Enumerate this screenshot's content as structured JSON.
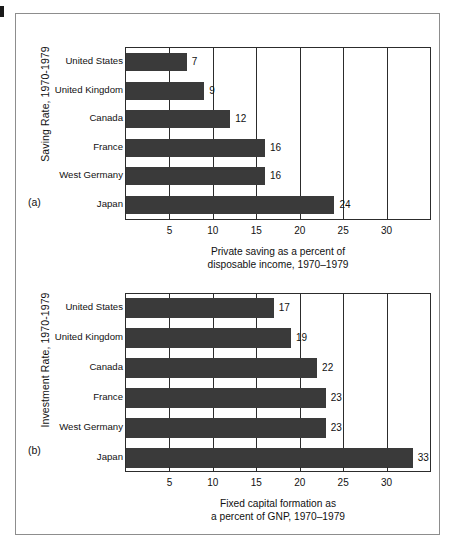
{
  "figure": {
    "panels": [
      {
        "id": "a",
        "panel_label": "(a)",
        "vertical_title": "Saving Rate, 1970-1979",
        "caption_line1": "Private saving as a percent of",
        "caption_line2": "disposable income, 1970–1979"
      },
      {
        "id": "b",
        "panel_label": "(b)",
        "vertical_title": "Investment Rate, 1970-1979",
        "caption_line1": "Fixed capital formation as",
        "caption_line2": "a percent of GNP, 1970–1979"
      }
    ]
  },
  "chart_data": [
    {
      "type": "bar",
      "orientation": "horizontal",
      "title": "Saving Rate, 1970-1979",
      "panel": "(a)",
      "xlabel": "Private saving as a percent of disposable income, 1970–1979",
      "ylabel": "",
      "categories": [
        "United States",
        "United Kingdom",
        "Canada",
        "France",
        "West Germany",
        "Japan"
      ],
      "values": [
        7,
        9,
        12,
        16,
        16,
        24
      ],
      "value_labels": [
        "7",
        "9",
        "12",
        "16",
        "16",
        "24"
      ],
      "xlim": [
        0,
        35
      ],
      "xticks": [
        5,
        10,
        15,
        20,
        25,
        30
      ],
      "xticklabels": [
        "5",
        "10",
        "15",
        "20",
        "25",
        "30"
      ],
      "grid": true,
      "legend": "none",
      "bar_color": "#3a3a3a"
    },
    {
      "type": "bar",
      "orientation": "horizontal",
      "title": "Investment Rate, 1970-1979",
      "panel": "(b)",
      "xlabel": "Fixed capital formation as a percent of GNP, 1970–1979",
      "ylabel": "",
      "categories": [
        "United States",
        "United Kingdom",
        "Canada",
        "France",
        "West Germany",
        "Japan"
      ],
      "values": [
        17,
        19,
        22,
        23,
        23,
        33
      ],
      "value_labels": [
        "17",
        "19",
        "22",
        "23",
        "23",
        "33"
      ],
      "xlim": [
        0,
        35
      ],
      "xticks": [
        5,
        10,
        15,
        20,
        25,
        30
      ],
      "xticklabels": [
        "5",
        "10",
        "15",
        "20",
        "25",
        "30"
      ],
      "grid": true,
      "legend": "none",
      "bar_color": "#3a3a3a"
    }
  ]
}
